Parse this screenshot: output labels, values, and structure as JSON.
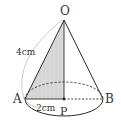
{
  "diagram": {
    "type": "cone",
    "points": {
      "O": {
        "label": "O",
        "x": 64,
        "y": 20
      },
      "A": {
        "label": "A",
        "x": 25,
        "y": 99
      },
      "B": {
        "label": "B",
        "x": 103,
        "y": 99
      },
      "P": {
        "label": "P",
        "x": 64,
        "y": 99
      }
    },
    "lengths": {
      "OA": "4cm",
      "AP": "2cm"
    },
    "colors": {
      "line": "#2a2a2a",
      "shade": "#d9d9d9",
      "arc": "#bdbdbd"
    }
  }
}
